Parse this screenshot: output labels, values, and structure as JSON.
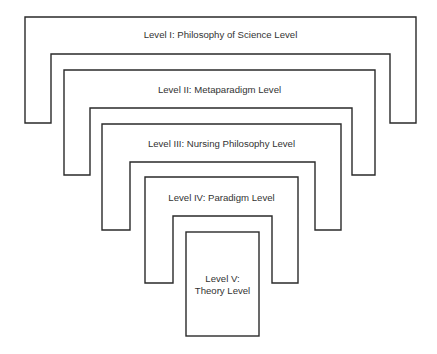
{
  "diagram": {
    "type": "nested-levels",
    "levels": [
      {
        "id": "level-1",
        "label": "Level I: Philosophy of Science Level"
      },
      {
        "id": "level-2",
        "label": "Level II: Metaparadigm Level"
      },
      {
        "id": "level-3",
        "label": "Level III: Nursing Philosophy Level"
      },
      {
        "id": "level-4",
        "label": "Level IV: Paradigm Level"
      },
      {
        "id": "level-5",
        "label_line1": "Level V:",
        "label_line2": "Theory Level"
      }
    ],
    "colors": {
      "stroke": "#2a2a2a",
      "text": "#333333",
      "background": "#ffffff"
    }
  }
}
